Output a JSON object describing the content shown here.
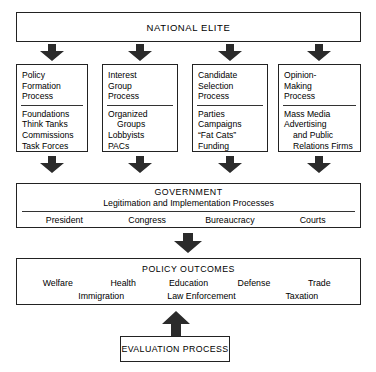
{
  "diagram": {
    "title_box": {
      "label": "NATIONAL ELITE"
    },
    "processes": [
      {
        "name": "policy-formation-process",
        "title": "Policy\nFormation\nProcess",
        "title_lines": [
          "Policy",
          "Formation",
          "Process"
        ],
        "items": [
          "Foundations",
          "Think Tanks",
          "Commissions",
          "Task Forces"
        ]
      },
      {
        "name": "interest-group-process",
        "title_lines": [
          "Interest",
          "Group",
          "Process"
        ],
        "items": [
          "Organized",
          "Groups",
          "Lobbyists",
          "PACs"
        ]
      },
      {
        "name": "candidate-selection-process",
        "title_lines": [
          "Candidate",
          "Selection",
          "Process"
        ],
        "items": [
          "Parties",
          "Campaigns",
          "“Fat Cats”",
          "Funding"
        ]
      },
      {
        "name": "opinion-making-process",
        "title_lines": [
          "Opinion-",
          "Making",
          "Process"
        ],
        "items": [
          "Mass Media",
          "Advertising",
          "and Public",
          "Relations Firms"
        ]
      }
    ],
    "government": {
      "title": "GOVERNMENT",
      "subtitle": "Legitimation and Implementation Processes",
      "branches": [
        "President",
        "Congress",
        "Bureaucracy",
        "Courts"
      ]
    },
    "policy_outcomes": {
      "title": "POLICY OUTCOMES",
      "row_top": [
        "Welfare",
        "Health",
        "Education",
        "Defense",
        "Trade"
      ],
      "row_bottom": [
        "Immigration",
        "Law Enforcement",
        "Taxation"
      ]
    },
    "evaluation": {
      "label": "EVALUATION PROCESS"
    },
    "arrows": {
      "down_icon": "arrow-down-icon",
      "up_icon": "arrow-up-icon"
    },
    "colors": {
      "arrow_fill": "#2b2b2b",
      "border": "#222222",
      "background": "#ffffff",
      "text": "#000000"
    }
  }
}
